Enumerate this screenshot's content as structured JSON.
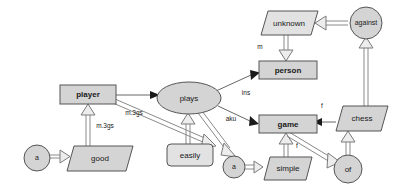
{
  "diagram": {
    "canvas": {
      "width": 398,
      "height": 193,
      "background": "#ffffff"
    },
    "palette": {
      "node_fill": "#d4d4d4",
      "node_fill_light": "#e2e2e2",
      "node_stroke": "#555555",
      "edge_stroke": "#666666",
      "edge_hollow_stroke": "#8a8a8a",
      "arrow_fill": "#1a1a1a",
      "arrow_hollow_fill": "#ededed",
      "text": "#1a1a1a"
    },
    "nodes": [
      {
        "id": "a_left",
        "label": "a",
        "shape": "circle",
        "cx": 37,
        "cy": 158,
        "rx": 13,
        "ry": 13,
        "bold": false
      },
      {
        "id": "good",
        "label": "good",
        "shape": "parallelogram",
        "cx": 89,
        "cy": 158,
        "w": 44,
        "h": 25,
        "skew": 7,
        "bold": false
      },
      {
        "id": "player",
        "label": "player",
        "shape": "rectangle",
        "cx": 88,
        "cy": 94,
        "w": 56,
        "h": 19,
        "bold": true
      },
      {
        "id": "plays",
        "label": "plays",
        "shape": "ellipse",
        "cx": 189,
        "cy": 98,
        "rx": 32,
        "ry": 16,
        "bold": false
      },
      {
        "id": "easily",
        "label": "easily",
        "shape": "roundrect",
        "cx": 189,
        "cy": 155,
        "w": 44,
        "h": 22,
        "bold": false
      },
      {
        "id": "a_mid",
        "label": "a",
        "shape": "circle",
        "cx": 234,
        "cy": 166,
        "rx": 11,
        "ry": 11,
        "bold": false
      },
      {
        "id": "simple",
        "label": "simple",
        "shape": "parallelogram",
        "cx": 286,
        "cy": 168,
        "w": 42,
        "h": 23,
        "skew": 7,
        "bold": false
      },
      {
        "id": "game",
        "label": "game",
        "shape": "rectangle",
        "cx": 286,
        "cy": 124,
        "w": 54,
        "h": 18,
        "bold": true
      },
      {
        "id": "of",
        "label": "of",
        "shape": "circle",
        "cx": 348,
        "cy": 168,
        "rx": 14,
        "ry": 14,
        "bold": false
      },
      {
        "id": "chess",
        "label": "chess",
        "shape": "parallelogram",
        "cx": 358,
        "cy": 118,
        "w": 44,
        "h": 25,
        "skew": 7,
        "bold": false
      },
      {
        "id": "person",
        "label": "person",
        "shape": "rectangle",
        "cx": 286,
        "cy": 70,
        "w": 54,
        "h": 18,
        "bold": true
      },
      {
        "id": "unknown",
        "label": "unknown",
        "shape": "parallelogram",
        "cx": 286,
        "cy": 23,
        "w": 52,
        "h": 23,
        "skew": 7,
        "bold": false
      },
      {
        "id": "against",
        "label": "against",
        "shape": "circle",
        "cx": 366,
        "cy": 23,
        "rx": 16,
        "ry": 16,
        "bold": false
      }
    ],
    "edges": [
      {
        "id": "e1",
        "from": "a_left",
        "to": "good",
        "head": "hollow",
        "label": ""
      },
      {
        "id": "e2",
        "from": "good",
        "to": "player",
        "head": "hollow",
        "label": "m.3gs"
      },
      {
        "id": "e3",
        "from": "player",
        "to": "plays",
        "head": "filled",
        "label": ""
      },
      {
        "id": "e4",
        "from": "player",
        "to": "easily",
        "head": "hollow",
        "label": "m.3gs"
      },
      {
        "id": "e5",
        "from": "easily",
        "to": "plays",
        "head": "hollow",
        "label": ""
      },
      {
        "id": "e6",
        "from": "plays",
        "to": "person",
        "head": "filled",
        "label": "ins"
      },
      {
        "id": "e7",
        "from": "plays",
        "to": "game",
        "head": "filled",
        "label": "aku"
      },
      {
        "id": "e8",
        "from": "plays",
        "to": "a_mid",
        "head": "hollow",
        "label": ""
      },
      {
        "id": "e9",
        "from": "a_mid",
        "to": "simple",
        "head": "hollow",
        "label": ""
      },
      {
        "id": "e10",
        "from": "simple",
        "to": "game",
        "head": "hollow",
        "label": ""
      },
      {
        "id": "e11",
        "from": "game",
        "to": "of",
        "head": "hollow",
        "label": "f"
      },
      {
        "id": "e12",
        "from": "of",
        "to": "chess",
        "head": "hollow",
        "label": ""
      },
      {
        "id": "e13",
        "from": "chess",
        "to": "game",
        "head": "filled",
        "label": "f"
      },
      {
        "id": "e14",
        "from": "chess",
        "to": "against",
        "head": "hollow",
        "label": ""
      },
      {
        "id": "e15",
        "from": "against",
        "to": "unknown",
        "head": "hollow",
        "label": ""
      },
      {
        "id": "e16",
        "from": "unknown",
        "to": "person",
        "head": "hollow",
        "label": "m"
      }
    ],
    "edge_labels": [
      {
        "id": "lbl_m3gs_left",
        "text": "m.3gs",
        "x": 105,
        "y": 126
      },
      {
        "id": "lbl_m3gs_diag",
        "text": "m.3gs",
        "x": 134,
        "y": 113
      },
      {
        "id": "lbl_ins",
        "text": "ins",
        "x": 246,
        "y": 93
      },
      {
        "id": "lbl_aku",
        "text": "aku",
        "x": 231,
        "y": 119
      },
      {
        "id": "lbl_m",
        "text": "m",
        "x": 260,
        "y": 47
      },
      {
        "id": "lbl_f_top",
        "text": "f",
        "x": 322,
        "y": 106
      },
      {
        "id": "lbl_f_bottom",
        "text": "f",
        "x": 297,
        "y": 146
      }
    ]
  }
}
